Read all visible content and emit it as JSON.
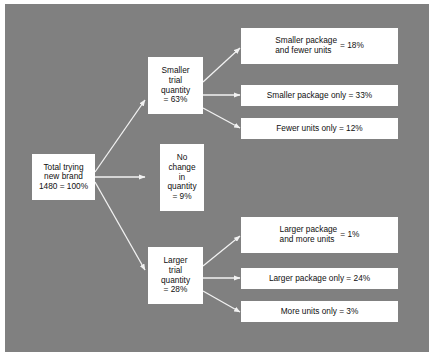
{
  "panel": {
    "background_color": "#808080",
    "box_fill": "#ffffff",
    "edge_color": "#f0f0f0",
    "text_color": "#101010"
  },
  "diagram": {
    "type": "tree",
    "title": "",
    "root": {
      "id": "total-trying-new-brand",
      "lines": [
        "Total trying",
        "new brand",
        "1480 = 100%"
      ],
      "count": "1480",
      "percent": "100%"
    },
    "branches": [
      {
        "id": "smaller-trial-quantity",
        "lines": [
          "Smaller",
          "trial",
          "quantity",
          "= 63%"
        ],
        "percent": "63%",
        "leaves": [
          {
            "id": "smaller-package-and-fewer-units",
            "label_lines": [
              "Smaller package",
              "and fewer units"
            ],
            "value": "= 18%",
            "percent": "18%",
            "layout": "split"
          },
          {
            "id": "smaller-package-only",
            "text": "Smaller package only = 33%",
            "percent": "33%",
            "layout": "inline"
          },
          {
            "id": "fewer-units-only",
            "text": "Fewer units only = 12%",
            "percent": "12%",
            "layout": "inline"
          }
        ]
      },
      {
        "id": "no-change-in-quantity",
        "lines": [
          "No",
          "change",
          "in",
          "quantity",
          "= 9%"
        ],
        "percent": "9%",
        "leaves": []
      },
      {
        "id": "larger-trial-quantity",
        "lines": [
          "Larger",
          "trial",
          "quantity",
          "= 28%"
        ],
        "percent": "28%",
        "leaves": [
          {
            "id": "larger-package-and-more-units",
            "label_lines": [
              "Larger package",
              "and more units"
            ],
            "value": "= 1%",
            "percent": "1%",
            "layout": "split"
          },
          {
            "id": "larger-package-only",
            "text": "Larger package only = 24%",
            "percent": "24%",
            "layout": "inline"
          },
          {
            "id": "more-units-only",
            "text": "More units only = 3%",
            "percent": "3%",
            "layout": "inline"
          }
        ]
      }
    ]
  }
}
